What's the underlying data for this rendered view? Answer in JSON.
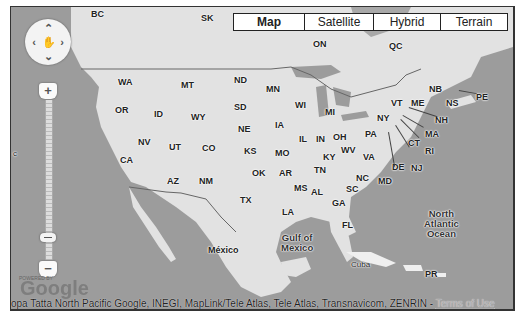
{
  "map_type_control": {
    "buttons": [
      {
        "label": "Map",
        "active": true
      },
      {
        "label": "Satellite",
        "active": false
      },
      {
        "label": "Hybrid",
        "active": false
      },
      {
        "label": "Terrain",
        "active": false
      }
    ]
  },
  "pan_control": {
    "up": "^",
    "down": "v",
    "left": "<",
    "right": ">",
    "center_icon": "hand-icon"
  },
  "zoom_control": {
    "plus": "+",
    "minus": "−"
  },
  "logo": {
    "powered_by": "POWERED BY",
    "text": "Google"
  },
  "attribution": {
    "text": "opa  Tatta  North Pacific  Google, INEGI, MapLink/Tele Atlas, Tele Atlas, Transnavicom, ZENRIN - ",
    "terms_link": "Terms of Use"
  },
  "labels": {
    "canada": [
      "BC",
      "SK",
      "ON",
      "QC",
      "NB",
      "NS",
      "PE"
    ],
    "states": [
      "WA",
      "MT",
      "ND",
      "MN",
      "OR",
      "ID",
      "SD",
      "WY",
      "WI",
      "MI",
      "VT",
      "ME",
      "NY",
      "NH",
      "NV",
      "UT",
      "CO",
      "NE",
      "IA",
      "IL",
      "IN",
      "OH",
      "PA",
      "MA",
      "CT",
      "RI",
      "CA",
      "KS",
      "MO",
      "KY",
      "WV",
      "VA",
      "NJ",
      "DE",
      "MD",
      "AZ",
      "NM",
      "OK",
      "AR",
      "TN",
      "NC",
      "MS",
      "AL",
      "SC",
      "GA",
      "TX",
      "LA",
      "FL",
      "PR"
    ],
    "countries": [
      "México",
      "Cuba"
    ],
    "water": {
      "gulf": "Gulf of\nMexico",
      "gulf_line1": "Gulf of",
      "gulf_line2": "Mexico",
      "atlantic_line1": "North",
      "atlantic_line2": "Atlantic",
      "atlantic_line3": "Ocean"
    },
    "edge_left": "c"
  },
  "colors": {
    "land": "#e6e6e6",
    "water": "#9a9a9a",
    "border": "#333333"
  }
}
